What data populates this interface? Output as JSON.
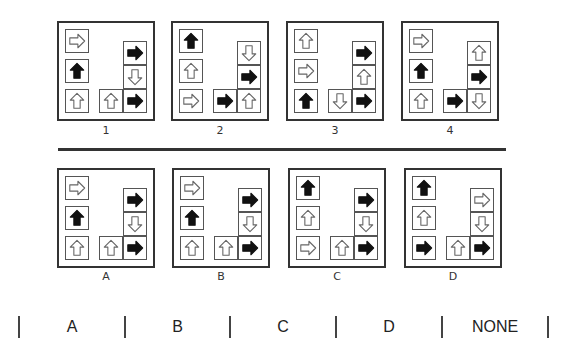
{
  "question_panels": [
    {
      "label": "1",
      "cells": [
        "right-outline",
        "up-filled",
        "up-outline",
        "right-filled",
        "down-outline",
        "up-outline",
        "right-filled"
      ]
    },
    {
      "label": "2",
      "cells": [
        "up-filled",
        "up-outline",
        "right-outline",
        "down-outline",
        "right-filled",
        "right-filled",
        "up-outline"
      ]
    },
    {
      "label": "3",
      "cells": [
        "up-outline",
        "right-outline",
        "up-filled",
        "right-filled",
        "up-outline",
        "down-outline",
        "right-filled"
      ]
    },
    {
      "label": "4",
      "cells": [
        "right-outline",
        "up-filled",
        "up-outline",
        "up-outline",
        "right-filled",
        "right-filled",
        "down-outline"
      ]
    }
  ],
  "option_panels": [
    {
      "label": "A",
      "cells": [
        "right-outline",
        "up-filled",
        "up-outline",
        "right-filled",
        "down-outline",
        "up-outline",
        "right-filled"
      ]
    },
    {
      "label": "B",
      "cells": [
        "right-outline",
        "up-filled",
        "up-outline",
        "right-filled",
        "down-outline",
        "up-outline",
        "right-filled"
      ]
    },
    {
      "label": "C",
      "cells": [
        "up-filled",
        "up-outline",
        "right-outline",
        "right-filled",
        "down-outline",
        "up-outline",
        "right-filled"
      ]
    },
    {
      "label": "D",
      "cells": [
        "up-filled",
        "up-outline",
        "right-filled",
        "right-outline",
        "down-outline",
        "up-outline",
        "right-filled"
      ]
    }
  ],
  "cell_layout_note_positions": [
    "left-top",
    "left-mid",
    "left-bottom",
    "right-top",
    "right-mid",
    "bottom-middle",
    "bottom-right"
  ],
  "answers": {
    "options": [
      "A",
      "B",
      "C",
      "D",
      "NONE"
    ]
  },
  "colors": {
    "arrow_fill": "#111111",
    "arrow_outline": "#666666",
    "border": "#333333"
  }
}
